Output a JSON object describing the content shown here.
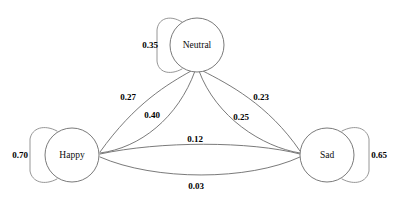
{
  "diagram": {
    "type": "state-transition-diagram",
    "title": "",
    "background_color": "#ffffff",
    "edge_color": "#6b6b6b",
    "node_fill": "#ffffff",
    "node_stroke": "#7a7a7a",
    "label_color": "#000000",
    "nodes": [
      {
        "id": "happy",
        "label": "Happy",
        "cx": 72,
        "cy": 155,
        "r": 27
      },
      {
        "id": "neutral",
        "label": "Neutral",
        "cx": 197,
        "cy": 45,
        "r": 27
      },
      {
        "id": "sad",
        "label": "Sad",
        "cx": 327,
        "cy": 155,
        "r": 27
      }
    ],
    "self_loops": [
      {
        "id": "happy-self",
        "from": "happy",
        "to": "happy",
        "weight": "0.70",
        "side": "left",
        "label_x": 20,
        "label_y": 155
      },
      {
        "id": "neutral-self",
        "from": "neutral",
        "to": "neutral",
        "weight": "0.35",
        "side": "left",
        "label_x": 150,
        "label_y": 45
      },
      {
        "id": "sad-self",
        "from": "sad",
        "to": "sad",
        "weight": "0.65",
        "side": "right",
        "label_x": 379,
        "label_y": 155
      }
    ],
    "edges": [
      {
        "id": "neutral-happy",
        "from": "neutral",
        "to": "happy",
        "weight": "0.27",
        "label_x": 128,
        "label_y": 97
      },
      {
        "id": "happy-neutral",
        "from": "happy",
        "to": "neutral",
        "weight": "0.40",
        "label_x": 152,
        "label_y": 115
      },
      {
        "id": "neutral-sad",
        "from": "neutral",
        "to": "sad",
        "weight": "0.23",
        "label_x": 261,
        "label_y": 97
      },
      {
        "id": "sad-neutral",
        "from": "sad",
        "to": "neutral",
        "weight": "0.25",
        "label_x": 241,
        "label_y": 117
      },
      {
        "id": "happy-sad",
        "from": "happy",
        "to": "sad",
        "weight": "0.12",
        "label_x": 195,
        "label_y": 139
      },
      {
        "id": "sad-happy",
        "from": "sad",
        "to": "happy",
        "weight": "0.03",
        "label_x": 196,
        "label_y": 186
      }
    ]
  }
}
